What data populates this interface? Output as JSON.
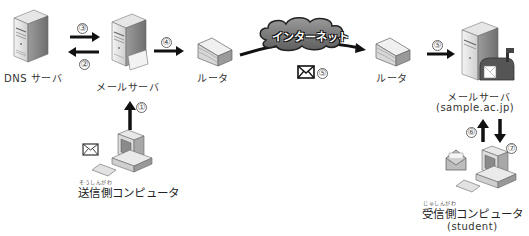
{
  "diagram": {
    "nodes": {
      "dns_server": {
        "label": "DNS サーバ"
      },
      "sender_mail_server": {
        "label": "メールサーバ"
      },
      "router_left": {
        "label": "ルータ"
      },
      "internet": {
        "label": "インターネット"
      },
      "router_right": {
        "label": "ルータ"
      },
      "receiver_mail_server": {
        "label": "メールサーバ",
        "sublabel": "(sample.ac.jp)"
      },
      "sender_pc": {
        "label": "送信側コンピュータ",
        "ruby": "そうしんがわ"
      },
      "receiver_pc": {
        "label": "受信側コンピュータ",
        "ruby": "じゅしんがわ",
        "sublabel": "(student)"
      }
    },
    "steps": {
      "s1": "①",
      "s2": "②",
      "s3": "③",
      "s4": "④",
      "s5a": "⑤",
      "s5b": "⑤",
      "s6": "⑥",
      "s7": "⑦"
    },
    "colors": {
      "arrow": "#111111",
      "cloud": "#7a7a7a",
      "server_body": "#e8e8e8",
      "server_shade": "#9a9a9a"
    }
  }
}
